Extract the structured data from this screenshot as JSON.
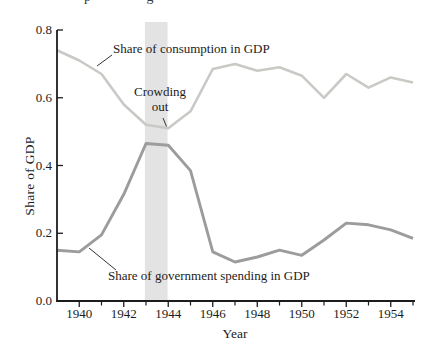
{
  "cropped_caption": {
    "fragments_text": "p g"
  },
  "chart": {
    "ylabel": "Share of GDP",
    "xlabel": "Year"
  },
  "chart_data": {
    "type": "line",
    "title": "",
    "xlabel": "Year",
    "ylabel": "Share of GDP",
    "xlim": [
      1939,
      1955
    ],
    "ylim": [
      0.0,
      0.8
    ],
    "grid": false,
    "legend": "inline-annotations",
    "x_major_ticks": [
      1940,
      1942,
      1944,
      1946,
      1948,
      1950,
      1952,
      1954
    ],
    "x_major_tick_labels": [
      "1940",
      "1942",
      "1944",
      "1946",
      "1948",
      "1950",
      "1952",
      "1954"
    ],
    "x_minor_ticks": [
      1941,
      1943,
      1945,
      1947,
      1949,
      1951,
      1953,
      1955
    ],
    "y_ticks": [
      0.0,
      0.2,
      0.4,
      0.6,
      0.8
    ],
    "y_tick_labels": [
      "0.0",
      "0.2",
      "0.4",
      "0.6",
      "0.8"
    ],
    "x": [
      1939,
      1940,
      1941,
      1942,
      1943,
      1944,
      1945,
      1946,
      1947,
      1948,
      1949,
      1950,
      1951,
      1952,
      1953,
      1954,
      1955
    ],
    "series": [
      {
        "name": "Share of consumption in GDP",
        "color": "#c8cac5",
        "values": [
          0.74,
          0.71,
          0.67,
          0.58,
          0.52,
          0.51,
          0.56,
          0.685,
          0.7,
          0.68,
          0.69,
          0.665,
          0.6,
          0.67,
          0.63,
          0.66,
          0.645
        ]
      },
      {
        "name": "Share of government spending in GDP",
        "color": "#9c9c9c",
        "values": [
          0.15,
          0.145,
          0.195,
          0.315,
          0.465,
          0.46,
          0.385,
          0.145,
          0.115,
          0.13,
          0.15,
          0.135,
          0.18,
          0.23,
          0.225,
          0.21,
          0.185
        ]
      }
    ],
    "shaded_band": {
      "label": "Crowding out",
      "x_start": 1942.95,
      "x_end": 1943.97,
      "color": "#e3e3e3"
    },
    "annotations": [
      {
        "text": "Share of consumption in GDP",
        "points_to": "consumption line near 1941"
      },
      {
        "text": "Crowding out",
        "points_to": "consumption minimum inside shaded band"
      },
      {
        "text": "Share of government spending in GDP",
        "points_to": "government line near 1940"
      }
    ]
  }
}
